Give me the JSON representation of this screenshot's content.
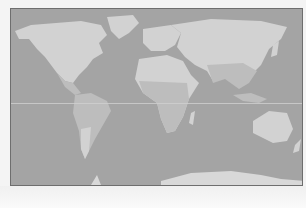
{
  "map": {
    "type": "world-map",
    "projection": "equirectangular",
    "colors": {
      "ocean": "#a4a4a4",
      "land_temperate": "#d2d2d2",
      "land_tropical": "#bdbdbd",
      "border": "#6e6e6e",
      "equator_line": "#cfcfcf"
    },
    "continents": [
      "North America",
      "South America",
      "Europe",
      "Africa",
      "Asia",
      "Australia",
      "Antarctica",
      "Greenland"
    ]
  }
}
